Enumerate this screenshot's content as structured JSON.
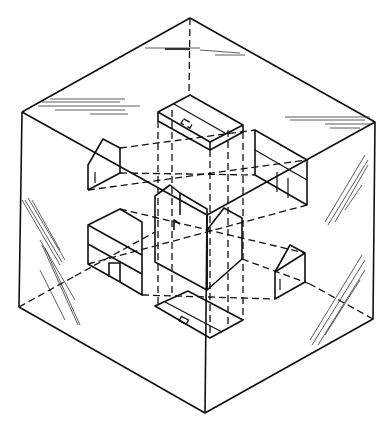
{
  "header": {
    "running_head": "PROJECTIONS 431"
  },
  "figure": {
    "views": [
      "top view",
      "front view",
      "right side view",
      "left side view",
      "bottom view",
      "rear view"
    ]
  }
}
